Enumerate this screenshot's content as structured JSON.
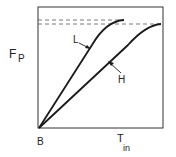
{
  "diagram": {
    "y_axis_label": "F",
    "y_axis_subscript": "P",
    "x_axis_origin_label": "B",
    "x_axis_label": "T",
    "x_axis_subscript": "in",
    "curves": [
      {
        "name": "L",
        "label": "L"
      },
      {
        "name": "H",
        "label": "H"
      }
    ],
    "colors": {
      "line": "#1a1a1a",
      "frame": "#333333",
      "dash": "#555555"
    }
  }
}
